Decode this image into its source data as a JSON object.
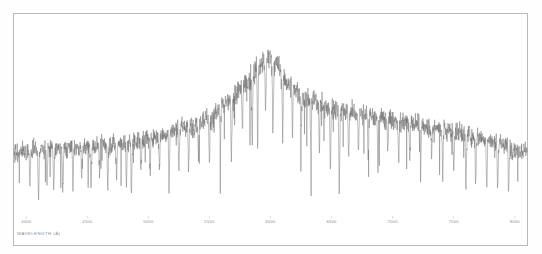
{
  "chart_data": {
    "type": "line",
    "title": "",
    "subtitle": "",
    "xlabel": "WAVELENGTH (Å)",
    "ylabel": "",
    "xlim": [
      3900,
      8100
    ],
    "ylim": [
      0,
      1.05
    ],
    "grid": false,
    "legend": null,
    "tick_labels": [
      "4000",
      "4500",
      "5000",
      "5500",
      "6000",
      "6500",
      "7000",
      "7500",
      "8000"
    ],
    "tick_values": [
      4000,
      4500,
      5000,
      5500,
      6000,
      6500,
      7000,
      7500,
      8000
    ],
    "series": [
      {
        "name": "flux",
        "color": "#6e6e6e",
        "continuum_x": [
          3950,
          4100,
          4300,
          4500,
          4700,
          4900,
          5100,
          5300,
          5500,
          5650,
          5800,
          5900,
          5980,
          6050,
          6150,
          6300,
          6500,
          6700,
          6900,
          7100,
          7300,
          7500,
          7700,
          7900,
          8050
        ],
        "continuum_y": [
          0.345,
          0.352,
          0.36,
          0.368,
          0.382,
          0.402,
          0.432,
          0.47,
          0.525,
          0.6,
          0.7,
          0.79,
          0.84,
          0.8,
          0.7,
          0.62,
          0.575,
          0.545,
          0.52,
          0.5,
          0.478,
          0.452,
          0.42,
          0.378,
          0.35
        ],
        "noise_amplitude": 0.055,
        "absorption_lines": [
          {
            "x": 4030,
            "depth": 0.2
          },
          {
            "x": 4101,
            "depth": 0.26
          },
          {
            "x": 4170,
            "depth": 0.17
          },
          {
            "x": 4226,
            "depth": 0.22
          },
          {
            "x": 4300,
            "depth": 0.24
          },
          {
            "x": 4383,
            "depth": 0.19
          },
          {
            "x": 4455,
            "depth": 0.16
          },
          {
            "x": 4530,
            "depth": 0.21
          },
          {
            "x": 4600,
            "depth": 0.15
          },
          {
            "x": 4668,
            "depth": 0.23
          },
          {
            "x": 4740,
            "depth": 0.18
          },
          {
            "x": 4820,
            "depth": 0.25
          },
          {
            "x": 4861,
            "depth": 0.3
          },
          {
            "x": 4940,
            "depth": 0.17
          },
          {
            "x": 5015,
            "depth": 0.22
          },
          {
            "x": 5090,
            "depth": 0.19
          },
          {
            "x": 5170,
            "depth": 0.28
          },
          {
            "x": 5250,
            "depth": 0.2
          },
          {
            "x": 5330,
            "depth": 0.24
          },
          {
            "x": 5410,
            "depth": 0.18
          },
          {
            "x": 5500,
            "depth": 0.26
          },
          {
            "x": 5590,
            "depth": 0.21
          },
          {
            "x": 5680,
            "depth": 0.3
          },
          {
            "x": 5770,
            "depth": 0.25
          },
          {
            "x": 5850,
            "depth": 0.34
          },
          {
            "x": 5895,
            "depth": 0.4
          },
          {
            "x": 5960,
            "depth": 0.28
          },
          {
            "x": 6020,
            "depth": 0.35
          },
          {
            "x": 6100,
            "depth": 0.3
          },
          {
            "x": 6180,
            "depth": 0.26
          },
          {
            "x": 6250,
            "depth": 0.22
          },
          {
            "x": 6330,
            "depth": 0.28
          },
          {
            "x": 6400,
            "depth": 0.2
          },
          {
            "x": 6490,
            "depth": 0.33
          },
          {
            "x": 6563,
            "depth": 0.42
          },
          {
            "x": 6640,
            "depth": 0.24
          },
          {
            "x": 6720,
            "depth": 0.19
          },
          {
            "x": 6800,
            "depth": 0.22
          },
          {
            "x": 6880,
            "depth": 0.26
          },
          {
            "x": 6960,
            "depth": 0.18
          },
          {
            "x": 7050,
            "depth": 0.21
          },
          {
            "x": 7140,
            "depth": 0.17
          },
          {
            "x": 7230,
            "depth": 0.23
          },
          {
            "x": 7320,
            "depth": 0.19
          },
          {
            "x": 7410,
            "depth": 0.25
          },
          {
            "x": 7500,
            "depth": 0.21
          },
          {
            "x": 7600,
            "depth": 0.3
          },
          {
            "x": 7680,
            "depth": 0.24
          },
          {
            "x": 7770,
            "depth": 0.28
          },
          {
            "x": 7860,
            "depth": 0.22
          },
          {
            "x": 7950,
            "depth": 0.26
          }
        ]
      }
    ]
  }
}
